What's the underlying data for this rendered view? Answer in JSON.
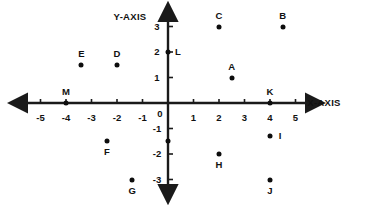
{
  "chart_data": {
    "type": "scatter",
    "title": "",
    "xlabel": "X-AXIS",
    "ylabel": "Y-AXIS",
    "xlim": [
      -5.8,
      5.8
    ],
    "ylim": [
      -3.7,
      3.7
    ],
    "grid": false,
    "legend": "none",
    "origin_label": "0",
    "x_ticks": [
      -5,
      -4,
      -3,
      -2,
      -1,
      1,
      2,
      3,
      4,
      5
    ],
    "x_tick_labels": [
      "-5",
      "-4",
      "-3",
      "-2",
      "-1",
      "1",
      "2",
      "3",
      "4",
      "5"
    ],
    "y_ticks": [
      3,
      2,
      1,
      -1,
      -2,
      -3
    ],
    "y_tick_labels": [
      "3",
      "2",
      "1",
      "-1",
      "-2",
      "-3"
    ],
    "points": [
      {
        "label": "A",
        "x": 2.5,
        "y": 1.0,
        "label_pos": "above"
      },
      {
        "label": "B",
        "x": 4.5,
        "y": 3.0,
        "label_pos": "above"
      },
      {
        "label": "C",
        "x": 2.0,
        "y": 3.0,
        "label_pos": "above"
      },
      {
        "label": "D",
        "x": -2.0,
        "y": 1.5,
        "label_pos": "above"
      },
      {
        "label": "E",
        "x": -3.4,
        "y": 1.5,
        "label_pos": "above"
      },
      {
        "label": "F",
        "x": -2.4,
        "y": -1.5,
        "label_pos": "below"
      },
      {
        "label": "G",
        "x": -1.4,
        "y": -3.0,
        "label_pos": "below"
      },
      {
        "label": "H",
        "x": 2.0,
        "y": -2.0,
        "label_pos": "below"
      },
      {
        "label": "I",
        "x": 4.0,
        "y": -1.3,
        "label_pos": "right"
      },
      {
        "label": "J",
        "x": 4.0,
        "y": -3.0,
        "label_pos": "below"
      },
      {
        "label": "K",
        "x": 4.0,
        "y": 0.0,
        "label_pos": "above"
      },
      {
        "label": "L",
        "x": 0.0,
        "y": 2.0,
        "label_pos": "right"
      },
      {
        "label": "M",
        "x": -4.0,
        "y": 0.0,
        "label_pos": "above"
      },
      {
        "label": "",
        "x": 0.0,
        "y": -1.5,
        "label_pos": "none"
      }
    ],
    "colors": {
      "axis": "#1a1a1a",
      "point": "#0d0d0d",
      "text": "#111111",
      "background": "#ffffff"
    }
  }
}
